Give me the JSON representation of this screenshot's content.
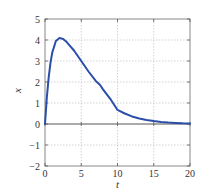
{
  "chart_data": {
    "type": "line",
    "title": "",
    "xlabel": "t",
    "ylabel": "x",
    "xlim": [
      0,
      20
    ],
    "ylim": [
      -2,
      5
    ],
    "xticks": [
      0,
      5,
      10,
      15,
      20
    ],
    "yticks": [
      -2,
      -1,
      0,
      1,
      2,
      3,
      4,
      5
    ],
    "grid": true,
    "legend": null,
    "series": [
      {
        "name": "x(t)",
        "color": "#2b4ea8",
        "x": [
          0,
          0.25,
          0.5,
          0.75,
          1,
          1.5,
          2,
          2.5,
          3,
          3.5,
          4,
          5,
          6,
          7,
          7.6,
          8,
          9,
          10,
          11,
          12,
          13,
          14,
          15,
          16,
          17,
          18,
          19,
          20
        ],
        "y": [
          0,
          1.25,
          2.2,
          2.9,
          3.4,
          3.95,
          4.1,
          4.05,
          3.9,
          3.7,
          3.5,
          3.0,
          2.5,
          2.05,
          1.86,
          1.65,
          1.2,
          0.67,
          0.5,
          0.36,
          0.26,
          0.19,
          0.14,
          0.1,
          0.07,
          0.05,
          0.03,
          0.02
        ]
      }
    ]
  },
  "colors": {
    "curve": "#2b4ea8",
    "frame": "#888888",
    "grid": "#c8c8c8",
    "zero_line": "#555555",
    "text": "#333333"
  }
}
